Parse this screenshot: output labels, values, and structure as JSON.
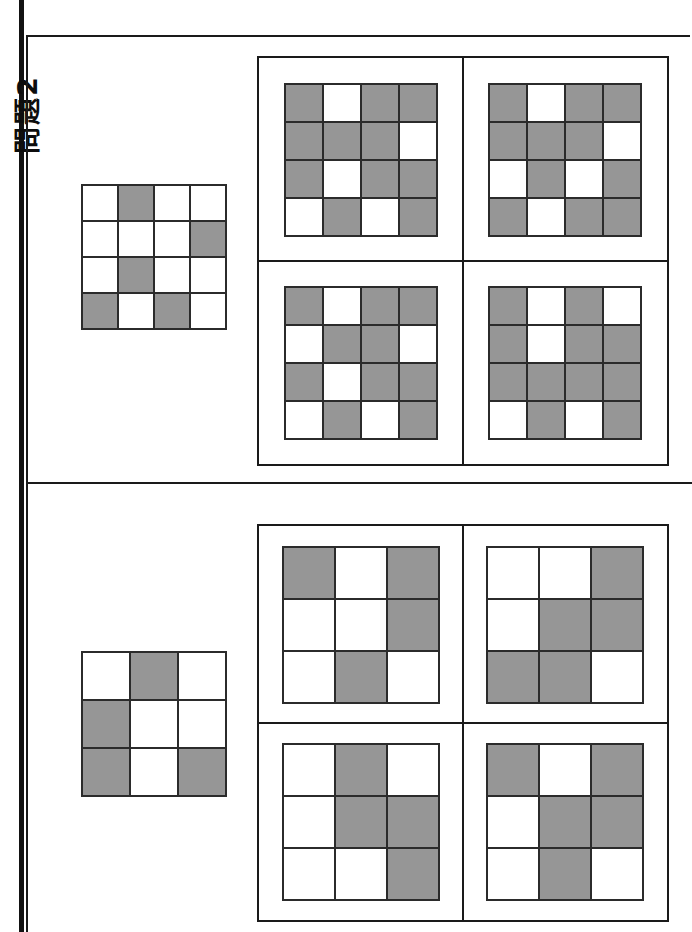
{
  "page": {
    "problem_label": "問題2",
    "colors": {
      "filled": "#969696",
      "empty": "#ffffff",
      "line": "#2b2b2b",
      "frame": "#1a1a1a",
      "binding": "#121212"
    }
  },
  "sections": [
    {
      "id": "section-top",
      "grid_size": 4,
      "reference": {
        "name": "reference-grid-top",
        "rows": [
          [
            "w",
            "g",
            "w",
            "w"
          ],
          [
            "w",
            "w",
            "w",
            "g"
          ],
          [
            "w",
            "g",
            "w",
            "w"
          ],
          [
            "g",
            "w",
            "g",
            "w"
          ]
        ]
      },
      "options": [
        {
          "name": "option-top-a",
          "position": "top-left",
          "rows": [
            [
              "g",
              "w",
              "g",
              "g"
            ],
            [
              "g",
              "g",
              "g",
              "w"
            ],
            [
              "g",
              "w",
              "g",
              "g"
            ],
            [
              "w",
              "g",
              "w",
              "g"
            ]
          ]
        },
        {
          "name": "option-top-b",
          "position": "top-right",
          "rows": [
            [
              "g",
              "w",
              "g",
              "g"
            ],
            [
              "g",
              "g",
              "g",
              "w"
            ],
            [
              "w",
              "g",
              "w",
              "g"
            ],
            [
              "g",
              "w",
              "g",
              "g"
            ]
          ]
        },
        {
          "name": "option-top-c",
          "position": "bottom-left",
          "rows": [
            [
              "g",
              "w",
              "g",
              "g"
            ],
            [
              "w",
              "g",
              "g",
              "w"
            ],
            [
              "g",
              "w",
              "g",
              "g"
            ],
            [
              "w",
              "g",
              "w",
              "g"
            ]
          ]
        },
        {
          "name": "option-top-d",
          "position": "bottom-right",
          "rows": [
            [
              "g",
              "w",
              "g",
              "w"
            ],
            [
              "g",
              "w",
              "g",
              "g"
            ],
            [
              "g",
              "g",
              "g",
              "g"
            ],
            [
              "w",
              "g",
              "w",
              "g"
            ]
          ]
        }
      ]
    },
    {
      "id": "section-bottom",
      "grid_size": 3,
      "reference": {
        "name": "reference-grid-bottom",
        "rows": [
          [
            "w",
            "g",
            "w"
          ],
          [
            "g",
            "w",
            "w"
          ],
          [
            "g",
            "w",
            "g"
          ]
        ]
      },
      "options": [
        {
          "name": "option-bottom-a",
          "position": "top-left",
          "rows": [
            [
              "g",
              "w",
              "g"
            ],
            [
              "w",
              "w",
              "g"
            ],
            [
              "w",
              "g",
              "w"
            ]
          ]
        },
        {
          "name": "option-bottom-b",
          "position": "top-right",
          "rows": [
            [
              "w",
              "w",
              "g"
            ],
            [
              "w",
              "g",
              "g"
            ],
            [
              "g",
              "g",
              "w"
            ]
          ]
        },
        {
          "name": "option-bottom-c",
          "position": "bottom-left",
          "rows": [
            [
              "w",
              "g",
              "w"
            ],
            [
              "w",
              "g",
              "g"
            ],
            [
              "w",
              "w",
              "g"
            ]
          ]
        },
        {
          "name": "option-bottom-d",
          "position": "bottom-right",
          "rows": [
            [
              "g",
              "w",
              "g"
            ],
            [
              "w",
              "g",
              "g"
            ],
            [
              "w",
              "g",
              "w"
            ]
          ]
        }
      ]
    }
  ]
}
